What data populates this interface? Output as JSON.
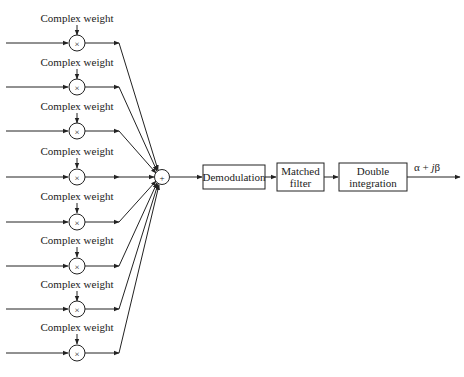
{
  "diagram": {
    "type": "block-diagram",
    "branches": [
      {
        "weight_label": "Complex weight",
        "operator": "×"
      },
      {
        "weight_label": "Complex weight",
        "operator": "×"
      },
      {
        "weight_label": "Complex weight",
        "operator": "×"
      },
      {
        "weight_label": "Complex weight",
        "operator": "×"
      },
      {
        "weight_label": "Complex weight",
        "operator": "×"
      },
      {
        "weight_label": "Complex weight",
        "operator": "×"
      },
      {
        "weight_label": "Complex weight",
        "operator": "×"
      },
      {
        "weight_label": "Complex weight",
        "operator": "×"
      }
    ],
    "summer": {
      "operator": "+"
    },
    "blocks": [
      {
        "line1": "Demodulation",
        "line2": ""
      },
      {
        "line1": "Matched",
        "line2": "filter"
      },
      {
        "line1": "Double",
        "line2": "integration"
      }
    ],
    "output_label": "α + jβ",
    "output_label_parts": {
      "alpha": "α + ",
      "j": "j",
      "beta": "β"
    }
  }
}
